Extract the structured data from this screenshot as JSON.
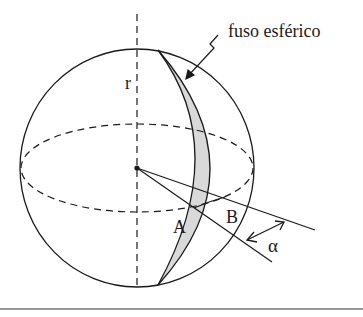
{
  "figure": {
    "caption_label": "fuso esférico",
    "radius_label": "r",
    "point_a_label": "A",
    "point_b_label": "B",
    "angle_label": "α"
  },
  "colors": {
    "stroke": "#1a1a1a",
    "lune_fill": "#d9d9d9",
    "background": "#ffffff"
  }
}
